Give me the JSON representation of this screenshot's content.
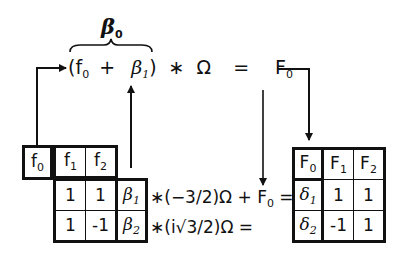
{
  "brace_label": {
    "symbol": "β",
    "sub": "0"
  },
  "equation": {
    "open": "(",
    "f0": {
      "symbol": "f",
      "sub": "0"
    },
    "plus": "+",
    "beta1": {
      "symbol": "β",
      "sub": "1"
    },
    "close": ")",
    "op": "∗",
    "omega": "Ω",
    "equals": "=",
    "F0": {
      "symbol": "F",
      "sub": "0"
    }
  },
  "left_table": {
    "header": [
      {
        "symbol": "f",
        "sub": "0"
      },
      {
        "symbol": "f",
        "sub": "1"
      },
      {
        "symbol": "f",
        "sub": "2"
      }
    ],
    "rows": [
      {
        "cells": [
          "1",
          "1"
        ],
        "beta": {
          "symbol": "β",
          "sub": "1"
        }
      },
      {
        "cells": [
          "1",
          "-1"
        ],
        "beta": {
          "symbol": "β",
          "sub": "2"
        }
      }
    ]
  },
  "side_expressions": [
    {
      "text": "∗(−3/2)Ω + ",
      "F": "F",
      "F_sub": "0",
      "tail": " ="
    },
    {
      "text": "∗(i√3/2)Ω =",
      "F": "",
      "F_sub": "",
      "tail": ""
    }
  ],
  "right_table": {
    "header": [
      {
        "symbol": "F",
        "sub": "0"
      },
      {
        "symbol": "F",
        "sub": "1"
      },
      {
        "symbol": "F",
        "sub": "2"
      }
    ],
    "rows": [
      {
        "delta": {
          "symbol": "δ",
          "sub": "1"
        },
        "cells": [
          "1",
          "1"
        ]
      },
      {
        "delta": {
          "symbol": "δ",
          "sub": "2"
        },
        "cells": [
          "-1",
          "1"
        ]
      }
    ]
  },
  "colors": {
    "ink": "#111111",
    "background": "#ffffff"
  }
}
